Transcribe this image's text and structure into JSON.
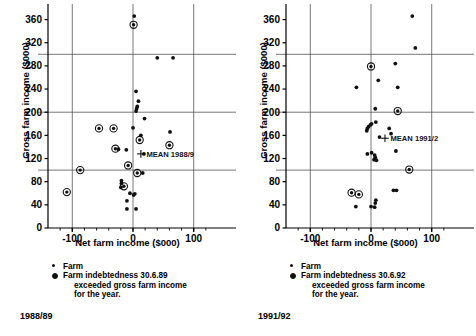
{
  "figure": {
    "axis": {
      "xlabel": "Net farm income ($000)",
      "ylabel": "Gross farm income ($000)",
      "xticks": [
        -100,
        0,
        100
      ],
      "xticklabels": [
        "-100",
        "0",
        "100"
      ],
      "yticks": [
        0,
        40,
        80,
        120,
        160,
        200,
        240,
        280,
        320,
        360
      ],
      "yticklabels": [
        "0",
        "40",
        "80",
        "120",
        "160",
        "200",
        "240",
        "280",
        "320",
        "360"
      ],
      "xlim": [
        -140,
        140
      ],
      "ylim": [
        0,
        380
      ],
      "vgridlines": [
        -100,
        0,
        100
      ],
      "hgridlines": [
        100,
        200,
        300
      ]
    },
    "legend": {
      "farm_label": "Farm",
      "indebted_label_left": "Farm indebtedness 30.6.89",
      "indebted_label_right": "Farm indebtedness 30.6.92",
      "indebted_cont_1": "exceeded gross farm income",
      "indebted_cont_2": "for the year."
    },
    "colors": {
      "marker": "#111111",
      "gridline": "#555555",
      "axis": "#000000",
      "background": "#ffffff"
    }
  },
  "chart_data": [
    {
      "type": "scatter",
      "id": "chart-1988-89",
      "title": "1988/89",
      "period": "1988/89",
      "xlabel": "Net farm income ($000)",
      "ylabel": "Gross farm income ($000)",
      "xlim": [
        -140,
        140
      ],
      "ylim": [
        0,
        380
      ],
      "grid": true,
      "legend_position": "below",
      "series": [
        {
          "name": "Farm",
          "marker": "dot",
          "points": [
            {
              "x": 2,
              "y": 366
            },
            {
              "x": 40,
              "y": 294
            },
            {
              "x": 66,
              "y": 294
            },
            {
              "x": 5,
              "y": 236
            },
            {
              "x": 9,
              "y": 219
            },
            {
              "x": 7,
              "y": 210
            },
            {
              "x": 6,
              "y": 206
            },
            {
              "x": 5,
              "y": 202
            },
            {
              "x": 19,
              "y": 189
            },
            {
              "x": 0,
              "y": 173
            },
            {
              "x": 61,
              "y": 166
            },
            {
              "x": 13,
              "y": 160
            },
            {
              "x": -24,
              "y": 136
            },
            {
              "x": -11,
              "y": 135
            },
            {
              "x": 18,
              "y": 128
            },
            {
              "x": 16,
              "y": 95
            },
            {
              "x": -19,
              "y": 82
            },
            {
              "x": -19,
              "y": 77
            },
            {
              "x": -20,
              "y": 70
            },
            {
              "x": -5,
              "y": 60
            },
            {
              "x": 3,
              "y": 59
            },
            {
              "x": 1,
              "y": 57
            },
            {
              "x": -10,
              "y": 47
            },
            {
              "x": -10,
              "y": 33
            },
            {
              "x": 5,
              "y": 33
            }
          ]
        },
        {
          "name": "Farm indebtedness 30.6.89 exceeded gross farm income for the year.",
          "marker": "ringed-dot",
          "points": [
            {
              "x": 1,
              "y": 351
            },
            {
              "x": -56,
              "y": 172
            },
            {
              "x": -32,
              "y": 172
            },
            {
              "x": 60,
              "y": 143
            },
            {
              "x": 11,
              "y": 152
            },
            {
              "x": -29,
              "y": 137
            },
            {
              "x": -8,
              "y": 108
            },
            {
              "x": -87,
              "y": 100
            },
            {
              "x": 7,
              "y": 95
            },
            {
              "x": -15,
              "y": 72
            },
            {
              "x": -109,
              "y": 62
            }
          ]
        }
      ],
      "mean_marker": {
        "label": "MEAN 1988/9",
        "x": 13,
        "y": 128
      }
    },
    {
      "type": "scatter",
      "id": "chart-1991-92",
      "title": "1991/92",
      "period": "1991/92",
      "xlabel": "Net farm income ($000)",
      "ylabel": "Gross farm income ($000)",
      "xlim": [
        -140,
        140
      ],
      "ylim": [
        0,
        380
      ],
      "grid": true,
      "legend_position": "below",
      "series": [
        {
          "name": "Farm",
          "marker": "dot",
          "points": [
            {
              "x": 68,
              "y": 366
            },
            {
              "x": 73,
              "y": 311
            },
            {
              "x": 40,
              "y": 284
            },
            {
              "x": 12,
              "y": 255
            },
            {
              "x": -24,
              "y": 243
            },
            {
              "x": 44,
              "y": 243
            },
            {
              "x": 7,
              "y": 206
            },
            {
              "x": 8,
              "y": 183
            },
            {
              "x": 1,
              "y": 180
            },
            {
              "x": -1,
              "y": 178
            },
            {
              "x": -4,
              "y": 175
            },
            {
              "x": -6,
              "y": 172
            },
            {
              "x": -7,
              "y": 168
            },
            {
              "x": 30,
              "y": 172
            },
            {
              "x": 33,
              "y": 163
            },
            {
              "x": 14,
              "y": 157
            },
            {
              "x": 41,
              "y": 133
            },
            {
              "x": 1,
              "y": 130
            },
            {
              "x": -6,
              "y": 128
            },
            {
              "x": 6,
              "y": 126
            },
            {
              "x": 7,
              "y": 122
            },
            {
              "x": 5,
              "y": 118
            },
            {
              "x": 9,
              "y": 117
            },
            {
              "x": 37,
              "y": 65
            },
            {
              "x": 42,
              "y": 65
            },
            {
              "x": 8,
              "y": 48
            },
            {
              "x": 7,
              "y": 43
            },
            {
              "x": 0,
              "y": 37
            },
            {
              "x": 6,
              "y": 36
            },
            {
              "x": -25,
              "y": 37
            }
          ]
        },
        {
          "name": "Farm indebtedness 30.6.92 exceeded gross farm income for the year.",
          "marker": "ringed-dot",
          "points": [
            {
              "x": 0,
              "y": 279
            },
            {
              "x": 44,
              "y": 202
            },
            {
              "x": 63,
              "y": 101
            },
            {
              "x": -32,
              "y": 61
            },
            {
              "x": -20,
              "y": 58
            }
          ]
        }
      ],
      "mean_marker": {
        "label": "MEAN 1991/2",
        "x": 23,
        "y": 155
      }
    }
  ]
}
